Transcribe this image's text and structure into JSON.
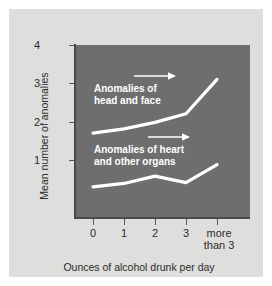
{
  "chart_data": {
    "type": "line",
    "title": "",
    "subtitle": "",
    "xlabel": "Ounces of alcohol drunk per day",
    "ylabel": "Mean number of anomalies",
    "categories": [
      "0",
      "1",
      "2",
      "3",
      "more than 3"
    ],
    "x_tick_labels": [
      {
        "line1": "0",
        "line2": ""
      },
      {
        "line1": "1",
        "line2": ""
      },
      {
        "line1": "2",
        "line2": ""
      },
      {
        "line1": "3",
        "line2": ""
      },
      {
        "line1": "more",
        "line2": "than 3"
      }
    ],
    "y_tick_labels": [
      "4",
      "3",
      "2",
      "1"
    ],
    "y_tick_values": [
      4,
      3,
      2,
      1
    ],
    "ylim": [
      0,
      4
    ],
    "xlim": [
      0,
      4
    ],
    "grid": false,
    "legend_position": "in-plot annotations",
    "plot_background_color": "#6e6e6e",
    "figure_background_color": "#dededc",
    "series_color": "#ffffff",
    "series": [
      {
        "name": "Anomalies of head and face",
        "values": [
          1.95,
          2.05,
          2.2,
          2.4,
          3.2
        ]
      },
      {
        "name": "Anomalies of heart and other organs",
        "values": [
          0.7,
          0.78,
          0.95,
          0.8,
          1.22
        ]
      }
    ],
    "annotations": [
      {
        "id": "head-and-face",
        "line1": "Anomalies of",
        "line2": "head and face",
        "arrow": "right"
      },
      {
        "id": "heart-and-other-organs",
        "line1": "Anomalies of heart",
        "line2": "and other organs",
        "arrow": "right"
      }
    ]
  }
}
